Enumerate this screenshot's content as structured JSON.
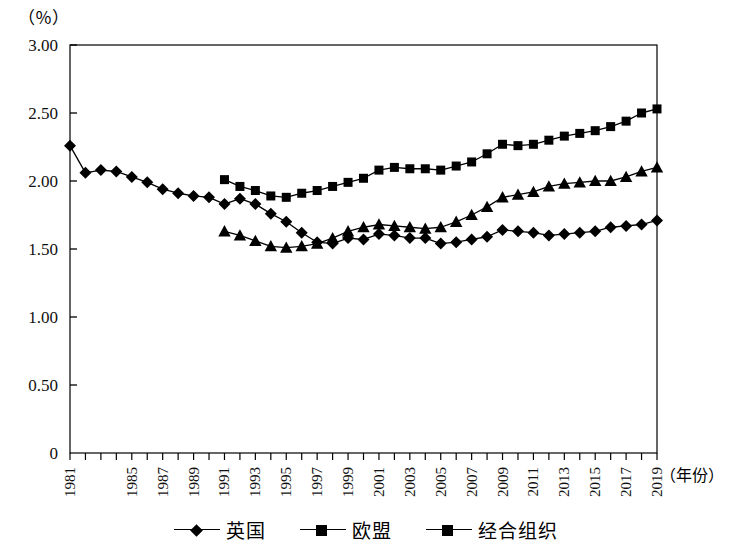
{
  "chart_data": {
    "type": "line",
    "title": "",
    "xlabel": "（年份）",
    "ylabel": "（％）",
    "unit_label": "（％）",
    "xlim": [
      1981,
      2019
    ],
    "ylim": [
      0,
      3.0
    ],
    "y_ticks": [
      "0",
      "0.50",
      "1.00",
      "1.50",
      "2.00",
      "2.50",
      "3.00"
    ],
    "y_tick_values": [
      0,
      0.5,
      1.0,
      1.5,
      2.0,
      2.5,
      3.0
    ],
    "x_tick_labels": [
      "1981",
      "1985",
      "1987",
      "1989",
      "1991",
      "1993",
      "1995",
      "1997",
      "1999",
      "2001",
      "2003",
      "2005",
      "2007",
      "2009",
      "2011",
      "2013",
      "2015",
      "2017",
      "2019"
    ],
    "x_tick_years": [
      1981,
      1985,
      1987,
      1989,
      1991,
      1993,
      1995,
      1997,
      1999,
      2001,
      2003,
      2005,
      2007,
      2009,
      2011,
      2013,
      2015,
      2017,
      2019
    ],
    "x_all_years": [
      1981,
      1982,
      1983,
      1984,
      1985,
      1986,
      1987,
      1988,
      1989,
      1990,
      1991,
      1992,
      1993,
      1994,
      1995,
      1996,
      1997,
      1998,
      1999,
      2000,
      2001,
      2002,
      2003,
      2004,
      2005,
      2006,
      2007,
      2008,
      2009,
      2010,
      2011,
      2012,
      2013,
      2014,
      2015,
      2016,
      2017,
      2018,
      2019
    ],
    "grid": false,
    "legend_position": "bottom",
    "series": [
      {
        "name": "英国",
        "marker": "diamond",
        "x": [
          1981,
          1982,
          1983,
          1984,
          1985,
          1986,
          1987,
          1988,
          1989,
          1990,
          1991,
          1992,
          1993,
          1994,
          1995,
          1996,
          1997,
          1998,
          1999,
          2000,
          2001,
          2002,
          2003,
          2004,
          2005,
          2006,
          2007,
          2008,
          2009,
          2010,
          2011,
          2012,
          2013,
          2014,
          2015,
          2016,
          2017,
          2018,
          2019
        ],
        "values": [
          2.26,
          2.06,
          2.08,
          2.07,
          2.03,
          1.99,
          1.94,
          1.91,
          1.89,
          1.88,
          1.83,
          1.87,
          1.83,
          1.76,
          1.7,
          1.62,
          1.55,
          1.54,
          1.58,
          1.57,
          1.61,
          1.6,
          1.58,
          1.58,
          1.54,
          1.55,
          1.57,
          1.59,
          1.64,
          1.63,
          1.62,
          1.6,
          1.61,
          1.62,
          1.63,
          1.66,
          1.67,
          1.68,
          1.71
        ]
      },
      {
        "name": "欧盟",
        "marker": "square",
        "x": [
          1991,
          1992,
          1993,
          1994,
          1995,
          1996,
          1997,
          1998,
          1999,
          2000,
          2001,
          2002,
          2003,
          2004,
          2005,
          2006,
          2007,
          2008,
          2009,
          2010,
          2011,
          2012,
          2013,
          2014,
          2015,
          2016,
          2017,
          2018,
          2019
        ],
        "values": [
          2.01,
          1.96,
          1.93,
          1.89,
          1.88,
          1.91,
          1.93,
          1.96,
          1.99,
          2.02,
          2.08,
          2.1,
          2.09,
          2.09,
          2.08,
          2.11,
          2.14,
          2.2,
          2.27,
          2.26,
          2.27,
          2.3,
          2.33,
          2.35,
          2.37,
          2.4,
          2.44,
          2.5,
          2.53
        ]
      },
      {
        "name": "经合组织",
        "marker": "triangle",
        "x": [
          1991,
          1992,
          1993,
          1994,
          1995,
          1996,
          1997,
          1998,
          1999,
          2000,
          2001,
          2002,
          2003,
          2004,
          2005,
          2006,
          2007,
          2008,
          2009,
          2010,
          2011,
          2012,
          2013,
          2014,
          2015,
          2016,
          2017,
          2018,
          2019
        ],
        "values": [
          1.63,
          1.6,
          1.56,
          1.52,
          1.51,
          1.52,
          1.54,
          1.58,
          1.63,
          1.66,
          1.68,
          1.67,
          1.66,
          1.65,
          1.66,
          1.7,
          1.75,
          1.81,
          1.88,
          1.9,
          1.92,
          1.96,
          1.98,
          1.99,
          2.0,
          2.0,
          2.03,
          2.07,
          2.1
        ]
      }
    ],
    "legend": [
      {
        "label": "英国",
        "marker": "diamond"
      },
      {
        "label": "欧盟",
        "marker": "square"
      },
      {
        "label": "经合组织",
        "marker": "square"
      }
    ]
  }
}
